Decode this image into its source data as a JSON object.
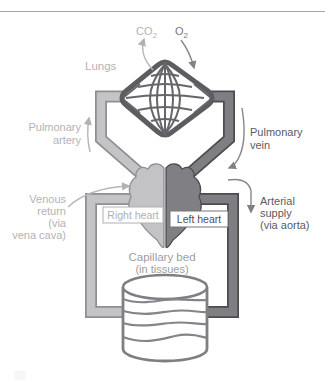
{
  "figure": {
    "type": "circulatory-system-diagram",
    "labels": {
      "co2": {
        "main": "CO",
        "sub": "2"
      },
      "o2": {
        "main": "O",
        "sub": "2"
      },
      "lungs": "Lungs",
      "pulmonary_artery": [
        "Pulmonary",
        "artery"
      ],
      "pulmonary_vein": [
        "Pulmonary",
        "vein"
      ],
      "venous_return": [
        "Venous",
        "return",
        "(via",
        "vena cava)"
      ],
      "arterial_supply": [
        "Arterial",
        "supply",
        "(via aorta)"
      ],
      "right_heart": "Right heart",
      "left_heart": "Left heart",
      "capillary_bed": [
        "Capillary bed",
        "(in tissues)"
      ]
    },
    "colors": {
      "venous_fill": "#c4c4c6",
      "venous_outline": "#8f8f93",
      "arterial_fill": "#7f7f83",
      "arterial_outline": "#4c4c50",
      "light_text": "#b3b3b6",
      "dark_text": "#5b5b5f",
      "mid_text": "#9d9da0",
      "mesh_line": "#66666a",
      "background": "#ffffff"
    }
  }
}
